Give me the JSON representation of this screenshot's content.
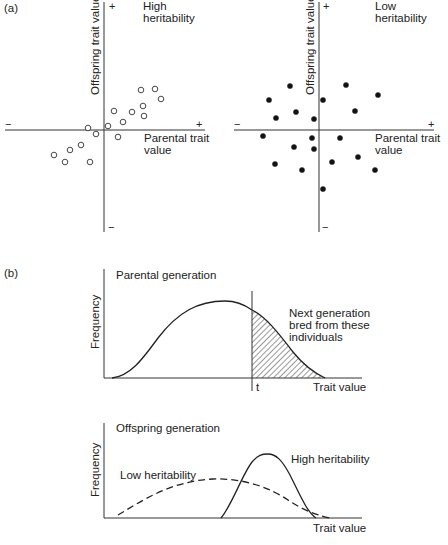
{
  "panel_a": {
    "label": "(a)",
    "left": {
      "title_line1": "High",
      "title_line2": "heritability",
      "ylabel": "Offspring trait value",
      "xlabel_line1": "Parental trait",
      "xlabel_line2": "value",
      "plus_y": "+",
      "minus_y": "−",
      "plus_x": "+",
      "minus_x": "−",
      "marker": "open-circle"
    },
    "right": {
      "title_line1": "Low",
      "title_line2": "heritability",
      "ylabel": "Offspring trait value",
      "xlabel_line1": "Parental trait",
      "xlabel_line2": "value",
      "plus_y": "+",
      "minus_y": "−",
      "plus_x": "+",
      "minus_x": "−",
      "marker": "filled-circle"
    }
  },
  "panel_b": {
    "label": "(b)",
    "parental": {
      "title": "Parental generation",
      "ylabel": "Frequency",
      "xlabel": "Trait value",
      "threshold_label": "t",
      "annotation_line1": "Next generation",
      "annotation_line2": "bred from these",
      "annotation_line3": "individuals"
    },
    "offspring": {
      "title": "Offspring generation",
      "ylabel": "Frequency",
      "xlabel": "Trait value",
      "low_label": "Low heritability",
      "high_label": "High heritability"
    }
  },
  "chart_data": [
    {
      "type": "scatter",
      "title": "High heritability",
      "xlabel": "Parental trait value",
      "ylabel": "Offspring trait value",
      "marker": "open circle",
      "note": "axes centered at origin; values in relative units (pixel offsets from origin, y up)",
      "points": [
        [
          38,
          40
        ],
        [
          52,
          41
        ],
        [
          58,
          31
        ],
        [
          40,
          24
        ],
        [
          41,
          14
        ],
        [
          11,
          19
        ],
        [
          29,
          18
        ],
        [
          20,
          8
        ],
        [
          5,
          4
        ],
        [
          -15,
          2
        ],
        [
          -7,
          -4
        ],
        [
          15,
          -7
        ],
        [
          -22,
          -15
        ],
        [
          -33,
          -20
        ],
        [
          -49,
          -25
        ],
        [
          -38,
          -32
        ],
        [
          -13,
          -32
        ]
      ]
    },
    {
      "type": "scatter",
      "title": "Low heritability",
      "xlabel": "Parental trait value",
      "ylabel": "Offspring trait value",
      "marker": "filled circle",
      "note": "axes centered at origin; values in relative units (pixel offsets from origin, y up)",
      "points": [
        [
          -30,
          44
        ],
        [
          26,
          45
        ],
        [
          58,
          35
        ],
        [
          -51,
          30
        ],
        [
          3,
          30
        ],
        [
          -24,
          18
        ],
        [
          35,
          19
        ],
        [
          -44,
          12
        ],
        [
          -6,
          11
        ],
        [
          -57,
          -6
        ],
        [
          -8,
          -8
        ],
        [
          20,
          -8
        ],
        [
          -26,
          -17
        ],
        [
          -6,
          -19
        ],
        [
          38,
          -27
        ],
        [
          -45,
          -34
        ],
        [
          12,
          -32
        ],
        [
          -18,
          -40
        ],
        [
          55,
          -40
        ],
        [
          3,
          -59
        ]
      ]
    },
    {
      "type": "area",
      "title": "Parental generation",
      "xlabel": "Trait value",
      "ylabel": "Frequency",
      "threshold": "t",
      "shaded_region": "trait value > t (hatched)",
      "annotation": "Next generation bred from these individuals",
      "curve": "unimodal, peak slightly left of t"
    },
    {
      "type": "line",
      "title": "Offspring generation",
      "xlabel": "Trait value",
      "ylabel": "Frequency",
      "series": [
        {
          "name": "Low heritability",
          "style": "dashed",
          "shape": "broad, low peak near parental mean"
        },
        {
          "name": "High heritability",
          "style": "solid",
          "shape": "narrow, tall peak shifted right toward selected group"
        }
      ]
    }
  ]
}
